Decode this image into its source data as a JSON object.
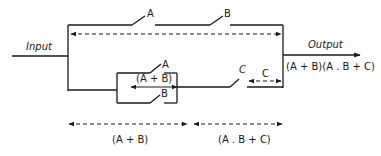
{
  "diagram": {
    "type": "switching circuit (series-parallel)",
    "labels": {
      "input": "Input",
      "output": "Output",
      "output_expression": "(A + B)(A . B + C)"
    },
    "top_branch": {
      "switches": [
        {
          "name": "A",
          "label": "A"
        },
        {
          "name": "B",
          "label": "B"
        }
      ],
      "description": "A and B in series"
    },
    "bottom_branch": {
      "parallel_group": {
        "switches": [
          {
            "name": "A",
            "label": "A"
          },
          {
            "name": "B",
            "label": "B"
          }
        ],
        "expression": "(A + B)"
      },
      "series_switch": {
        "name": "C",
        "label": "C"
      },
      "c_label": "C"
    },
    "bottom_annotations": [
      {
        "label": "(A + B)"
      },
      {
        "label": "(A . B + C)"
      }
    ]
  }
}
